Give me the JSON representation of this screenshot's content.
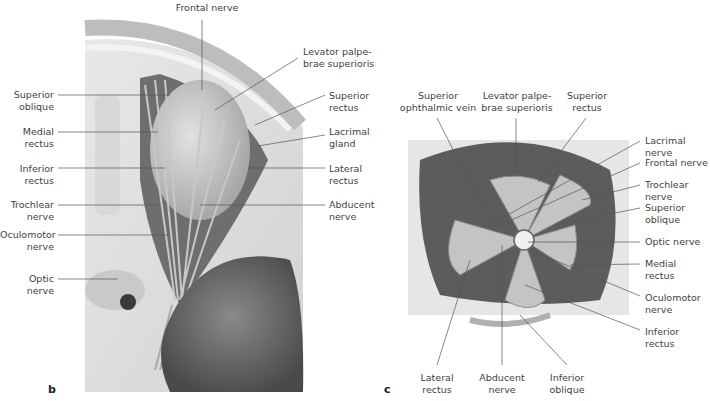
{
  "figure": {
    "panels": [
      {
        "letter": "b",
        "view": "Orbit from above (superior view)",
        "labels": {
          "frontal_nerve": "Frontal nerve",
          "levator": "Levator palpe-\nbrae superioris",
          "superior_rectus": "Superior\nrectus",
          "lacrimal_gland": "Lacrimal\ngland",
          "lateral_rectus": "Lateral\nrectus",
          "abducent_nerve": "Abducent\nnerve",
          "superior_oblique": "Superior\noblique",
          "medial_rectus": "Medial\nrectus",
          "inferior_rectus": "Inferior\nrectus",
          "trochlear_nerve": "Trochlear\nnerve",
          "oculomotor_nerve": "Oculomotor\nnerve",
          "optic_nerve": "Optic nerve"
        }
      },
      {
        "letter": "c",
        "view": "Orbit from anterior (eyeball removed)",
        "labels": {
          "superior_ophthalmic_vein": "Superior\nophthalmic vein",
          "levator": "Levator palpe-\nbrae superioris",
          "superior_rectus": "Superior\nrectus",
          "lacrimal_nerve": "Lacrimal nerve",
          "frontal_nerve": "Frontal nerve",
          "trochlear_nerve": "Trochlear nerve",
          "superior_oblique": "Superior\noblique",
          "optic_nerve": "Optic nerve",
          "medial_rectus": "Medial\nrectus",
          "oculomotor_nerve": "Oculomotor\nnerve",
          "inferior_rectus": "Inferior\nrectus",
          "lateral_rectus": "Lateral\nrectus",
          "abducent_nerve": "Abducent\nnerve",
          "inferior_oblique": "Inferior\noblique"
        }
      }
    ]
  }
}
